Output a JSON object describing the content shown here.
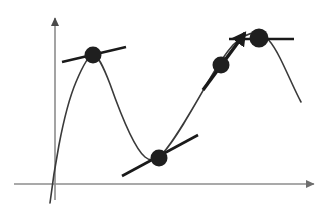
{
  "figure": {
    "width": 326,
    "height": 216,
    "background_color": "#ffffff"
  },
  "colors": {
    "axis": "#8c8c8c",
    "curve": "#3a3a3a",
    "tangent": "#1a1a1a",
    "point": "#1f1f1f",
    "arrow": "#1a1a1a"
  },
  "axes": {
    "x_axis": {
      "name": "x-axis",
      "from_x": 14,
      "from_y": 184,
      "to_x": 314,
      "to_y": 184,
      "stroke_width": 1.6,
      "arrowhead": "right"
    },
    "y_axis": {
      "name": "y-axis",
      "from_x": 55,
      "from_y": 200,
      "to_x": 55,
      "to_y": 18,
      "stroke_width": 1.6,
      "arrowhead": "up"
    },
    "origin_x": 55,
    "origin_y": 184
  },
  "curve": {
    "name": "function-curve",
    "stroke_width": 1.6,
    "path": "M 50,203 C 53,178 62,115 76,82 C 84,63 89,55 93,55 C 98,55 103,66 110,84 C 122,118 134,148 145,157 C 151,162 156,160 163,153 C 175,140 192,110 208,82 C 216,68 224,55 233,45 C 242,36 250,32 258,33 C 266,34 273,44 280,58 C 288,74 295,91 301,102"
  },
  "points": [
    {
      "id": "point-1",
      "label": "local-maximum-point",
      "x": 93,
      "y": 55,
      "radius": 8.5,
      "tangent": {
        "id": "tangent-1",
        "label": "horizontal-tangent-at-maximum",
        "from_x": 62,
        "from_y": 62,
        "to_x": 126,
        "to_y": 47,
        "stroke_width": 2.6,
        "has_arrow": false
      }
    },
    {
      "id": "point-2",
      "label": "local-minimum-point",
      "x": 159,
      "y": 158,
      "radius": 8.5,
      "tangent": {
        "id": "tangent-2",
        "label": "tangent-at-minimum",
        "from_x": 122,
        "from_y": 176,
        "to_x": 198,
        "to_y": 135,
        "stroke_width": 2.6,
        "has_arrow": false
      }
    },
    {
      "id": "point-3",
      "label": "inflection-rising-point",
      "x": 221,
      "y": 65,
      "radius": 8.5,
      "tangent": {
        "id": "tangent-3",
        "label": "steep-tangent-with-arrow",
        "from_x": 203,
        "from_y": 90,
        "to_x": 245,
        "to_y": 33,
        "stroke_width": 3.4,
        "has_arrow": true
      }
    },
    {
      "id": "point-4",
      "label": "right-maximum-point",
      "x": 259,
      "y": 38,
      "radius": 9.5,
      "tangent": {
        "id": "tangent-4",
        "label": "horizontal-tangent-at-right-maximum",
        "from_x": 229,
        "from_y": 39,
        "to_x": 294,
        "to_y": 39,
        "stroke_width": 2.6,
        "has_arrow": false
      }
    }
  ]
}
